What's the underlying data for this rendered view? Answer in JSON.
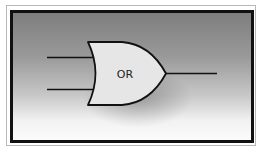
{
  "diagram": {
    "type": "logic-gate",
    "gate": {
      "kind": "OR",
      "label": "OR",
      "fill": "#e6e6e6",
      "stroke": "#111111",
      "inputs": 2,
      "outputs": 1
    },
    "frame": {
      "outer_border_color": "#b8b8b8",
      "inner_border_color": "#111111",
      "background_top": "#7e7e7e",
      "background_bottom": "#fbfbfb"
    }
  }
}
